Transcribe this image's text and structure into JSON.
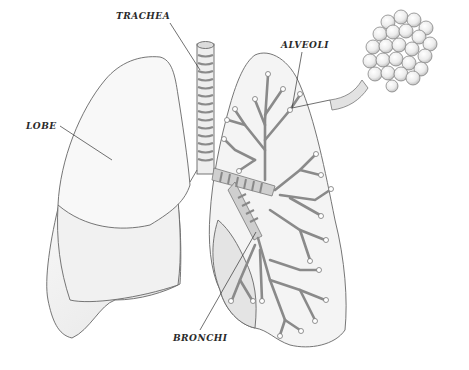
{
  "diagram": {
    "style": "pencil sketch, grayscale",
    "labels": {
      "trachea": "TRACHEA",
      "alveoli": "ALVEOLI",
      "lobe": "LOBE",
      "bronchi": "BRONCHI"
    },
    "parts": [
      {
        "id": "trachea",
        "label": "TRACHEA",
        "target": "windpipe (ringed tube, top center)"
      },
      {
        "id": "alveoli",
        "label": "ALVEOLI",
        "target": "branch tip in left lung, shown magnified as grape-like cluster at upper right"
      },
      {
        "id": "lobe",
        "label": "LOBE",
        "target": "upper lobe of right lung (viewer's left)"
      },
      {
        "id": "bronchi",
        "label": "BRONCHI",
        "target": "bronchial tree inside left lung (viewer's right)"
      }
    ],
    "colors": {
      "outline": "#555555",
      "fill": "#f3f3f3",
      "shade": "#d9d9d9",
      "airway": "#9a9a9a",
      "text": "#2a2a2a"
    }
  }
}
